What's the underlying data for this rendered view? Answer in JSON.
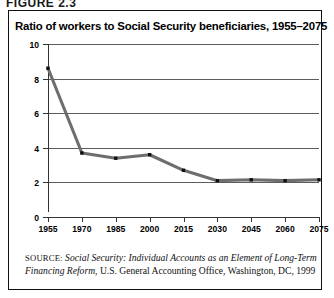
{
  "figure": {
    "label": "FIGURE 2.3",
    "title": "Ratio of workers to Social Security beneficiaries, 1955–2075"
  },
  "caption": {
    "source_word": "SOURCE:",
    "source_title": "Social Security: Individual Accounts as an Element of Long-Term Financing Reform",
    "source_rest": ", U.S. General Accounting Office, Washington, DC, 1999"
  },
  "colors": {
    "line": "#6e6e6e",
    "marker": "#101010",
    "grid": "#5c5c5c",
    "axis": "#333333",
    "border": "#111111",
    "text": "#000000"
  },
  "chart_data": {
    "type": "line",
    "title": "Ratio of workers to Social Security beneficiaries, 1955–2075",
    "xlabel": "",
    "ylabel": "",
    "x": [
      1955,
      1970,
      1985,
      2000,
      2015,
      2030,
      2045,
      2060,
      2075
    ],
    "categories": [
      "1955",
      "1970",
      "1985",
      "2000",
      "2015",
      "2030",
      "2045",
      "2060",
      "2075"
    ],
    "values": [
      8.6,
      3.7,
      3.4,
      3.6,
      2.7,
      2.1,
      2.15,
      2.1,
      2.15
    ],
    "series": [
      {
        "name": "Workers per beneficiary",
        "values": [
          8.6,
          3.7,
          3.4,
          3.6,
          2.7,
          2.1,
          2.15,
          2.1,
          2.15
        ]
      }
    ],
    "ylim": [
      0,
      10
    ],
    "yticks": [
      0,
      2,
      4,
      6,
      8,
      10
    ],
    "ytick_labels": [
      "0",
      "2",
      "4",
      "6",
      "8",
      "10"
    ],
    "xlim": [
      1955,
      2075
    ],
    "grid": true,
    "grid_axis": "y",
    "legend": false,
    "markers": "square"
  }
}
